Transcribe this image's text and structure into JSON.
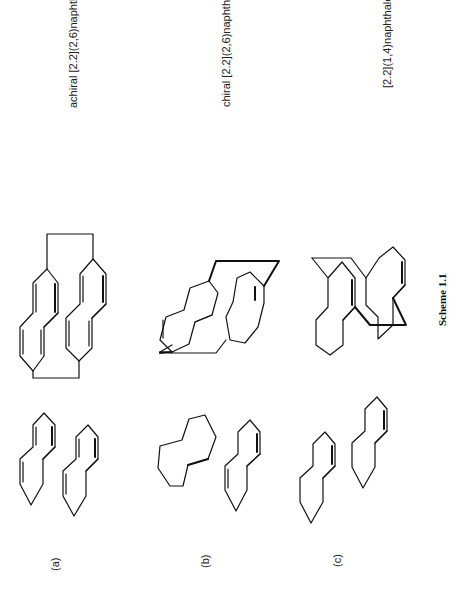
{
  "figure": {
    "caption": "Scheme 1.1",
    "rows": [
      {
        "label": "(a)",
        "name": "achiral [2.2](2,6)naphthalenophane"
      },
      {
        "label": "(b)",
        "name": "chiral [2.2](2,6)naphthalenophane"
      },
      {
        "label": "(c)",
        "name": "[2.2](1,4)naphthalenophane"
      }
    ]
  }
}
